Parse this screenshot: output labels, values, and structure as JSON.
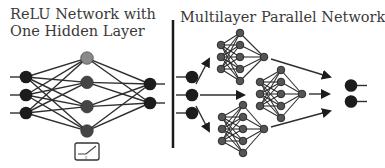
{
  "left_panel": {
    "title_line1": "ReLU Network with",
    "title_line2": "One Hidden Layer",
    "layers": {
      "input_nodes": 3,
      "hidden_nodes": 4,
      "output_nodes": 2
    },
    "activation_icon": "relu-icon",
    "activation_label": "0"
  },
  "right_panel": {
    "title": "Multilayer Parallel Network",
    "input_nodes": 3,
    "subnetworks": [
      {
        "position": "top",
        "inputs": 3,
        "hidden": 5,
        "outputs": 1
      },
      {
        "position": "middle",
        "inputs": 3,
        "hidden": 5,
        "outputs": 1
      },
      {
        "position": "bottom",
        "inputs": 3,
        "hidden": 5,
        "outputs": 1
      }
    ],
    "output_nodes": 2
  },
  "colors": {
    "node_dark": "#1c1c1c",
    "node_hidden": "#454545",
    "node_hidden_top": "#8a8a8a",
    "node_subnet": "#555555",
    "edge": "#2e2e2e",
    "divider": "#1a1a1a",
    "text": "#3a3a3a"
  }
}
